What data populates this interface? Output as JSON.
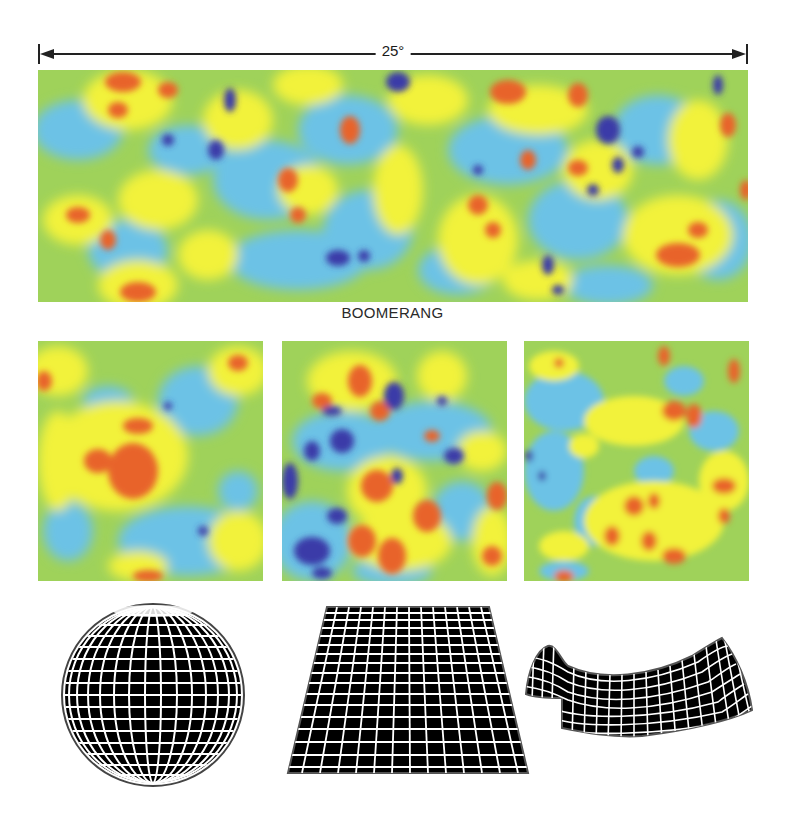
{
  "figure": {
    "scale_bar": {
      "label": "25°"
    },
    "main_map": {
      "caption": "BOOMERANG"
    },
    "palette": {
      "deep_cold": "#3a3aa8",
      "cold": "#6cc2e6",
      "mid": "#9fd25a",
      "warm": "#f2f23a",
      "hot": "#e8632a"
    },
    "panels": [
      {
        "name": "simulated-map-closed-universe",
        "spot_size": "large"
      },
      {
        "name": "simulated-map-flat-universe",
        "spot_size": "medium"
      },
      {
        "name": "simulated-map-open-universe",
        "spot_size": "small"
      }
    ],
    "geometries": [
      {
        "name": "sphere",
        "shape": "sphere-grid-icon"
      },
      {
        "name": "flat-plane",
        "shape": "plane-grid-icon"
      },
      {
        "name": "saddle",
        "shape": "saddle-grid-icon"
      }
    ]
  }
}
